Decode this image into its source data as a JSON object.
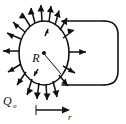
{
  "figure": {
    "type": "physics-diagram",
    "background_color": "#ffffff",
    "ink_color": "#111111",
    "labels": {
      "radius": "R",
      "charge": "Q",
      "charge_subscript": "o",
      "length": "l",
      "radial_distance": "r"
    },
    "geometry": {
      "cylinder": {
        "face_center_x": 44,
        "face_center_y": 53,
        "face_radius_x": 25,
        "face_radius_y": 32,
        "body_right_x": 118,
        "body_top_y": 21,
        "body_bottom_y": 85,
        "cap_radius": 14
      },
      "radial_arrows_count": 20,
      "measure_bar": {
        "start_x": 36,
        "end_x": 69,
        "y": 110,
        "tick_height": 10
      }
    }
  }
}
